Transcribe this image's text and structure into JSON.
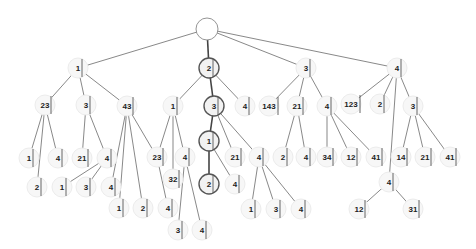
{
  "diagram": {
    "type": "tree",
    "highlight_color": "#555555",
    "nodes": [
      {
        "id": "root",
        "label": "",
        "x": 207,
        "y": 29,
        "r": 11,
        "root": true
      },
      {
        "id": "n1",
        "label": "1",
        "x": 78,
        "y": 68
      },
      {
        "id": "n2",
        "label": "2",
        "x": 209,
        "y": 68,
        "hl": true
      },
      {
        "id": "n3",
        "label": "3",
        "x": 306,
        "y": 68
      },
      {
        "id": "n4",
        "label": "4",
        "x": 397,
        "y": 68
      },
      {
        "id": "n1_23",
        "label": "23",
        "x": 45,
        "y": 105
      },
      {
        "id": "n1_3",
        "label": "3",
        "x": 86,
        "y": 105
      },
      {
        "id": "n1_43",
        "label": "43",
        "x": 127,
        "y": 106
      },
      {
        "id": "n2_1",
        "label": "1",
        "x": 173,
        "y": 106
      },
      {
        "id": "n2_3",
        "label": "3",
        "x": 214,
        "y": 106,
        "hl": true
      },
      {
        "id": "n2_4",
        "label": "4",
        "x": 245,
        "y": 106
      },
      {
        "id": "n3_143",
        "label": "143",
        "x": 269,
        "y": 106
      },
      {
        "id": "n3_21",
        "label": "21",
        "x": 297,
        "y": 106
      },
      {
        "id": "n3_4",
        "label": "4",
        "x": 327,
        "y": 106
      },
      {
        "id": "n4_123",
        "label": "123",
        "x": 351,
        "y": 104
      },
      {
        "id": "n4_2",
        "label": "2",
        "x": 380,
        "y": 104
      },
      {
        "id": "n4_3",
        "label": "3",
        "x": 413,
        "y": 106
      },
      {
        "id": "a1",
        "label": "1",
        "x": 29,
        "y": 158
      },
      {
        "id": "a4",
        "label": "4",
        "x": 58,
        "y": 158
      },
      {
        "id": "a21",
        "label": "21",
        "x": 82,
        "y": 158
      },
      {
        "id": "a4b",
        "label": "4",
        "x": 107,
        "y": 158
      },
      {
        "id": "b2",
        "label": "2",
        "x": 37,
        "y": 187
      },
      {
        "id": "b1",
        "label": "1",
        "x": 62,
        "y": 187
      },
      {
        "id": "b3",
        "label": "3",
        "x": 86,
        "y": 187
      },
      {
        "id": "b4",
        "label": "4",
        "x": 111,
        "y": 187
      },
      {
        "id": "c23",
        "label": "23",
        "x": 157,
        "y": 157
      },
      {
        "id": "c4",
        "label": "4",
        "x": 185,
        "y": 157
      },
      {
        "id": "c32",
        "label": "32",
        "x": 173,
        "y": 179
      },
      {
        "id": "c1",
        "label": "1",
        "x": 119,
        "y": 208
      },
      {
        "id": "c2",
        "label": "2",
        "x": 143,
        "y": 208
      },
      {
        "id": "c4b",
        "label": "4",
        "x": 168,
        "y": 208
      },
      {
        "id": "c3",
        "label": "3",
        "x": 178,
        "y": 230
      },
      {
        "id": "c4c",
        "label": "4",
        "x": 202,
        "y": 230
      },
      {
        "id": "d1",
        "label": "1",
        "x": 209,
        "y": 141,
        "hl": true
      },
      {
        "id": "d21",
        "label": "21",
        "x": 235,
        "y": 157
      },
      {
        "id": "d2",
        "label": "2",
        "x": 209,
        "y": 184,
        "hl": true
      },
      {
        "id": "d4",
        "label": "4",
        "x": 235,
        "y": 184
      },
      {
        "id": "e4",
        "label": "4",
        "x": 259,
        "y": 157
      },
      {
        "id": "e2",
        "label": "2",
        "x": 283,
        "y": 157
      },
      {
        "id": "e4b",
        "label": "4",
        "x": 306,
        "y": 157
      },
      {
        "id": "e1",
        "label": "1",
        "x": 251,
        "y": 209
      },
      {
        "id": "e3",
        "label": "3",
        "x": 276,
        "y": 209
      },
      {
        "id": "e4c",
        "label": "4",
        "x": 301,
        "y": 209
      },
      {
        "id": "f34",
        "label": "34",
        "x": 327,
        "y": 157
      },
      {
        "id": "f12",
        "label": "12",
        "x": 351,
        "y": 157
      },
      {
        "id": "f41",
        "label": "41",
        "x": 376,
        "y": 157
      },
      {
        "id": "g14",
        "label": "14",
        "x": 401,
        "y": 157
      },
      {
        "id": "g21",
        "label": "21",
        "x": 425,
        "y": 157
      },
      {
        "id": "g41",
        "label": "41",
        "x": 450,
        "y": 157
      },
      {
        "id": "h4",
        "label": "4",
        "x": 389,
        "y": 182
      },
      {
        "id": "h12",
        "label": "12",
        "x": 359,
        "y": 209
      },
      {
        "id": "h31",
        "label": "31",
        "x": 413,
        "y": 209
      }
    ],
    "edges": [
      [
        "root",
        "n1"
      ],
      [
        "root",
        "n2",
        true
      ],
      [
        "root",
        "n3"
      ],
      [
        "root",
        "n4"
      ],
      [
        "n1",
        "n1_23"
      ],
      [
        "n1",
        "n1_3"
      ],
      [
        "n1",
        "n1_43"
      ],
      [
        "n2",
        "n2_1"
      ],
      [
        "n2",
        "n2_3",
        true
      ],
      [
        "n2",
        "n2_4"
      ],
      [
        "n3",
        "n3_143"
      ],
      [
        "n3",
        "n3_21"
      ],
      [
        "n3",
        "n3_4"
      ],
      [
        "n4",
        "n4_123"
      ],
      [
        "n4",
        "n4_2"
      ],
      [
        "n4",
        "n4_3"
      ],
      [
        "n4",
        "h4"
      ],
      [
        "n1_23",
        "a1"
      ],
      [
        "n1_23",
        "a4"
      ],
      [
        "n1_23",
        "b2"
      ],
      [
        "n1_3",
        "a21"
      ],
      [
        "n1_3",
        "a4b"
      ],
      [
        "a4b",
        "b1"
      ],
      [
        "a4b",
        "b3"
      ],
      [
        "n1_43",
        "b4"
      ],
      [
        "n1_43",
        "c1"
      ],
      [
        "n1_43",
        "c2"
      ],
      [
        "n1_43",
        "c23"
      ],
      [
        "n2_1",
        "c23"
      ],
      [
        "n2_1",
        "c32"
      ],
      [
        "n2_1",
        "c4"
      ],
      [
        "c23",
        "c4b"
      ],
      [
        "c4",
        "c3"
      ],
      [
        "c4",
        "c4c"
      ],
      [
        "n2_3",
        "d1",
        true
      ],
      [
        "n2_3",
        "d21"
      ],
      [
        "n2_3",
        "e4"
      ],
      [
        "d1",
        "d2",
        true
      ],
      [
        "d1",
        "d4"
      ],
      [
        "e4",
        "e1"
      ],
      [
        "e4",
        "e3"
      ],
      [
        "e4",
        "e4c"
      ],
      [
        "n3_21",
        "e2"
      ],
      [
        "n3_21",
        "e4b"
      ],
      [
        "n3_4",
        "f34"
      ],
      [
        "n3_4",
        "f12"
      ],
      [
        "n3_4",
        "f41"
      ],
      [
        "n4_3",
        "g14"
      ],
      [
        "n4_3",
        "g21"
      ],
      [
        "n4_3",
        "g41"
      ],
      [
        "h4",
        "h12"
      ],
      [
        "h4",
        "h31"
      ]
    ]
  }
}
